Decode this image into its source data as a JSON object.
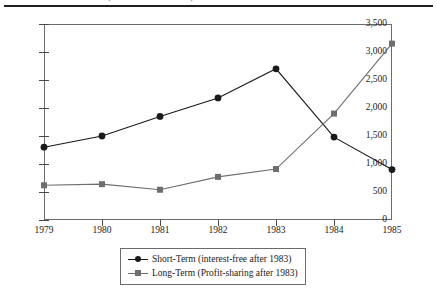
{
  "top": {
    "title_fragment": "(continued from above)"
  },
  "chart_data": {
    "type": "line",
    "title": "",
    "xlabel": "",
    "ylabel": "",
    "x": [
      1979,
      1980,
      1981,
      1982,
      1983,
      1984,
      1985
    ],
    "categories": [
      "1979",
      "1980",
      "1981",
      "1982",
      "1983",
      "1984",
      "1985"
    ],
    "xlim": [
      1979,
      1985
    ],
    "ylim": [
      0,
      3500
    ],
    "y_ticks": [
      0,
      500,
      1000,
      1500,
      2000,
      2500,
      3000,
      3500
    ],
    "y_tick_labels": [
      "0",
      "500",
      "1,000",
      "1,500",
      "2,000",
      "2,500",
      "3,000",
      "3,500"
    ],
    "grid": false,
    "legend_position": "below-center",
    "series": [
      {
        "name": "Short-Term (interest-free after 1983)",
        "short_name": "Short-Term",
        "marker": "circle",
        "color": "#1a1a1a",
        "values": [
          1300,
          1500,
          1850,
          2180,
          2700,
          1480,
          900
        ]
      },
      {
        "name": "Long-Term (Profit-sharing after 1983)",
        "short_name": "Long-Term",
        "marker": "square",
        "color": "#6e6e6e",
        "values": [
          620,
          640,
          540,
          770,
          910,
          1900,
          3150
        ]
      }
    ]
  }
}
